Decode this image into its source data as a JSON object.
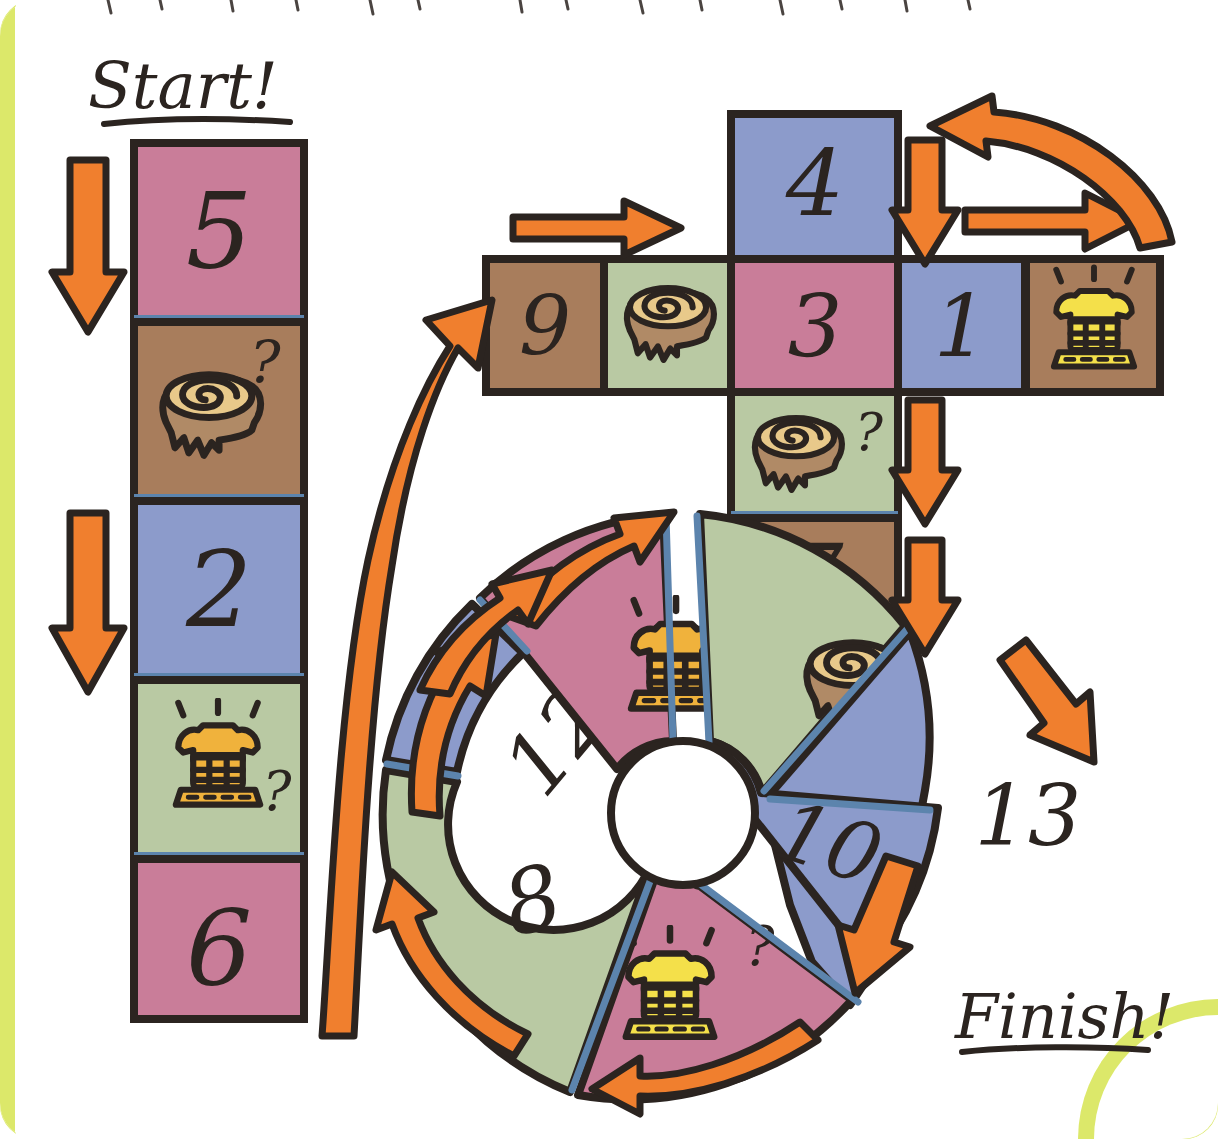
{
  "page": {
    "background_color": "#ffffff",
    "page_edge_color": "#dce86a",
    "ink_color": "#2b2420"
  },
  "palette": {
    "pink": "#c97d99",
    "blue": "#8c9bcb",
    "green": "#b9c9a3",
    "brown": "#a87d5c",
    "orange": "#f07f2e",
    "yellow": "#f4e04a",
    "gold": "#f0b23c",
    "tan": "#e8c98a",
    "divider_blue": "#5c84ad",
    "outline": "#2b2420"
  },
  "labels": {
    "start": "Start!",
    "finish": "Finish!"
  },
  "icons": {
    "stump": "tree-stump-icon",
    "phone": "telephone-icon",
    "question": "?"
  },
  "start_column": {
    "name": "start-column",
    "spaces": [
      {
        "id": "s5",
        "number": "5",
        "color": "pink",
        "icon": null,
        "question": false
      },
      {
        "id": "sA",
        "number": "",
        "color": "brown",
        "icon": "stump",
        "question": true
      },
      {
        "id": "s2",
        "number": "2",
        "color": "blue",
        "icon": null,
        "question": false
      },
      {
        "id": "sB",
        "number": "",
        "color": "green",
        "icon": "phone",
        "question": true
      },
      {
        "id": "s6",
        "number": "6",
        "color": "pink",
        "icon": null,
        "question": false
      }
    ]
  },
  "cross_row": {
    "name": "cross-row",
    "spaces": [
      {
        "id": "r9",
        "number": "9",
        "color": "brown",
        "icon": null,
        "question": false
      },
      {
        "id": "rA",
        "number": "",
        "color": "green",
        "icon": "stump",
        "question": false
      },
      {
        "id": "r3",
        "number": "3",
        "color": "pink",
        "icon": null,
        "question": false
      },
      {
        "id": "r1",
        "number": "1",
        "color": "blue",
        "icon": null,
        "question": false
      },
      {
        "id": "rB",
        "number": "",
        "color": "brown",
        "icon": "phone",
        "question": false
      }
    ]
  },
  "cross_column": {
    "name": "cross-column",
    "spaces": [
      {
        "id": "c4",
        "number": "4",
        "color": "blue",
        "icon": null,
        "question": false
      },
      {
        "id": "cA",
        "number": "",
        "color": "green",
        "icon": "stump",
        "question": true
      },
      {
        "id": "c7",
        "number": "7",
        "color": "brown",
        "icon": null,
        "question": false
      }
    ]
  },
  "wheel": {
    "name": "wheel-ring",
    "segments": [
      {
        "id": "w12",
        "number": "12",
        "color": "blue",
        "icon": null,
        "question": false
      },
      {
        "id": "wA",
        "number": "",
        "color": "pink",
        "icon": "phone",
        "question": false
      },
      {
        "id": "wB",
        "number": "",
        "color": "green",
        "icon": "stump",
        "question": false
      },
      {
        "id": "w13",
        "number": "13",
        "color": "blue",
        "icon": null,
        "question": false
      },
      {
        "id": "w10",
        "number": "10",
        "color": "blue",
        "icon": null,
        "question": false
      },
      {
        "id": "wC",
        "number": "",
        "color": "pink",
        "icon": "phone",
        "question": true
      },
      {
        "id": "w8",
        "number": "8",
        "color": "green",
        "icon": null,
        "question": false
      }
    ]
  },
  "arrows": [
    {
      "id": "a1",
      "name": "arrow-down-start-top",
      "direction": "down"
    },
    {
      "id": "a2",
      "name": "arrow-down-start-bottom",
      "direction": "down"
    },
    {
      "id": "a3",
      "name": "arrow-curve-up-to-nine",
      "direction": "up"
    },
    {
      "id": "a4",
      "name": "arrow-right-into-nine",
      "direction": "right"
    },
    {
      "id": "a5",
      "name": "arrow-down-after-one",
      "direction": "down"
    },
    {
      "id": "a6",
      "name": "arrow-right-to-phone",
      "direction": "right"
    },
    {
      "id": "a7",
      "name": "arrow-curve-back-to-four",
      "direction": "left"
    },
    {
      "id": "a8",
      "name": "arrow-down-to-seven",
      "direction": "down"
    },
    {
      "id": "a9",
      "name": "arrow-down-right-of-seven",
      "direction": "down"
    },
    {
      "id": "a10",
      "name": "arrow-down-right-to-wheel",
      "direction": "down-right"
    },
    {
      "id": "a11",
      "name": "arrow-down-into-ten",
      "direction": "down"
    },
    {
      "id": "a12",
      "name": "arrow-left-under-wheel",
      "direction": "left"
    },
    {
      "id": "a13",
      "name": "arrow-up-left-of-wheel",
      "direction": "up"
    },
    {
      "id": "a14",
      "name": "arrow-up-left-upper",
      "direction": "up"
    },
    {
      "id": "a15",
      "name": "arrow-up-right-top-wheel",
      "direction": "up-right"
    },
    {
      "id": "a16",
      "name": "arrow-up-right-mid-wheel",
      "direction": "up-right"
    }
  ]
}
